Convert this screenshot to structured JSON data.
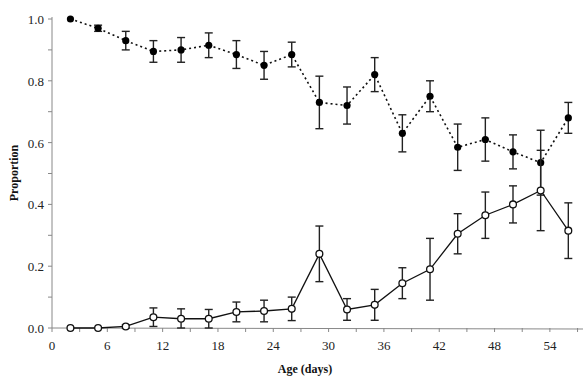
{
  "chart_data": {
    "type": "line",
    "title": "",
    "xlabel": "Age (days)",
    "ylabel": "Proportion",
    "xlim": [
      0,
      57.5
    ],
    "ylim": [
      0,
      1.0
    ],
    "xticks": [
      0,
      6,
      12,
      18,
      24,
      30,
      36,
      42,
      48,
      54
    ],
    "yticks": [
      0.0,
      0.2,
      0.4,
      0.6,
      0.8,
      1.0
    ],
    "ytick_labels": [
      "0.0",
      "0.2",
      "0.4",
      "0.6",
      "0.8",
      "1.0"
    ],
    "grid": false,
    "legend": null,
    "x": [
      2,
      5,
      8,
      11,
      14,
      17,
      20,
      23,
      26,
      29,
      32,
      35,
      38,
      41,
      44,
      47,
      50,
      53,
      56
    ],
    "series": [
      {
        "name": "filled circles (dotted line)",
        "marker": "filled-circle",
        "line_style": "dotted",
        "values": [
          1.0,
          0.97,
          0.93,
          0.895,
          0.9,
          0.915,
          0.885,
          0.85,
          0.885,
          0.73,
          0.72,
          0.82,
          0.63,
          0.75,
          0.585,
          0.61,
          0.57,
          0.535,
          0.68
        ],
        "error": [
          0.0,
          0.01,
          0.03,
          0.035,
          0.04,
          0.04,
          0.045,
          0.045,
          0.04,
          0.085,
          0.06,
          0.055,
          0.06,
          0.05,
          0.075,
          0.07,
          0.055,
          0.105,
          0.05
        ]
      },
      {
        "name": "open circles (solid line)",
        "marker": "open-circle",
        "line_style": "solid",
        "values": [
          0.0,
          0.0,
          0.005,
          0.035,
          0.03,
          0.03,
          0.052,
          0.055,
          0.062,
          0.24,
          0.06,
          0.075,
          0.145,
          0.19,
          0.305,
          0.365,
          0.4,
          0.445,
          0.315
        ],
        "error": [
          0.0,
          0.0,
          0.005,
          0.03,
          0.032,
          0.03,
          0.032,
          0.035,
          0.038,
          0.09,
          0.035,
          0.05,
          0.05,
          0.1,
          0.065,
          0.075,
          0.06,
          0.13,
          0.09
        ]
      }
    ]
  }
}
